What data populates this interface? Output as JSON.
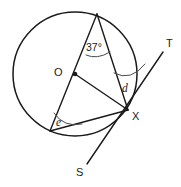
{
  "figure": {
    "kind": "circle-geometry-diagram",
    "width": 181,
    "height": 187,
    "background_color": "#ffffff",
    "stroke_color": "#1a1a1a",
    "arc_color": "#4a4a4a"
  },
  "circle": {
    "center_label": "O",
    "center_x": 75,
    "center_y": 74,
    "radius": 62
  },
  "points": {
    "center": {
      "label": "O",
      "x": 75,
      "y": 74,
      "label_x": 54,
      "label_y": 67
    },
    "top": {
      "label": "",
      "x": 97,
      "y": 14
    },
    "tangency": {
      "label": "X",
      "x": 128,
      "y": 110,
      "label_x": 132,
      "label_y": 111
    },
    "lower_left": {
      "label": "",
      "x": 50,
      "y": 131
    },
    "tangent_end_t": {
      "label": "T",
      "x": 163,
      "y": 52,
      "label_x": 166,
      "label_y": 38
    },
    "tangent_end_s": {
      "label": "S",
      "x": 87,
      "y": 164,
      "label_x": 76,
      "label_y": 167
    }
  },
  "angles": [
    {
      "name": "inscribed-angle-top",
      "label": "37°",
      "value": 37,
      "unit": "degrees",
      "vertex": "top",
      "label_x": 86,
      "label_y": 42
    },
    {
      "name": "tangent-chord-angle",
      "label": "d",
      "value": null,
      "unit": "unknown",
      "vertex": "X",
      "label_x": 122,
      "label_y": 83
    },
    {
      "name": "inscribed-angle-lower-left",
      "label": "e",
      "value": null,
      "unit": "unknown",
      "vertex": "lower_left",
      "label_x": 56,
      "label_y": 117
    }
  ],
  "lines": {
    "tangent_line": {
      "from": "S",
      "to": "T",
      "through": "X"
    },
    "radius_to_x": {
      "from": "O",
      "to": "X"
    },
    "chord_top_to_x": {
      "from": "top",
      "to": "X"
    },
    "diameter_top_to_lower_left": {
      "from": "top",
      "through": "O",
      "to": "lower_left"
    },
    "chord_lower_left_to_x": {
      "from": "lower_left",
      "to": "X"
    }
  }
}
